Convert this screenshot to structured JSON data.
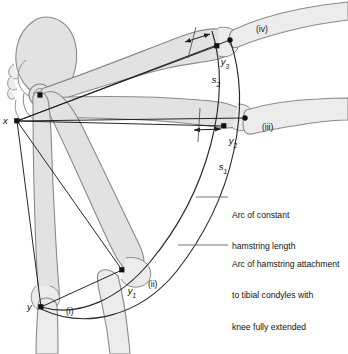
{
  "figure": {
    "type": "anatomical-biomechanics-diagram"
  },
  "points": {
    "x": {
      "label": "x",
      "desc": "hamstring origin at ischial tuberosity",
      "cx": 17,
      "cy": 121
    },
    "y": {
      "label": "y",
      "sub": "",
      "desc": "hamstring attachment, position (i)",
      "cx": 41,
      "cy": 307
    },
    "y1": {
      "label": "y",
      "sub": "1",
      "desc": "hamstring attachment, position (ii)",
      "cx": 122,
      "cy": 270
    },
    "y2": {
      "label": "y",
      "sub": "2",
      "desc": "hamstring attachment, position (iii)",
      "cx": 224,
      "cy": 126
    },
    "y3": {
      "label": "y",
      "sub": "3",
      "desc": "hamstring attachment, position (iv)",
      "cx": 217,
      "cy": 46
    },
    "c3": {
      "desc": "tibial condyle point position (iii)",
      "cx": 245,
      "cy": 118
    },
    "c4": {
      "desc": "tibial condyle point position (iv)",
      "cx": 230,
      "cy": 40
    },
    "hip": {
      "desc": "hip joint centre / femoral head",
      "cx": 40,
      "cy": 95
    }
  },
  "measures": {
    "s1": {
      "label": "s",
      "sub": "1",
      "desc": "shortfall of hamstring length, position (iii)"
    },
    "s2": {
      "label": "s",
      "sub": "2",
      "desc": "shortfall of hamstring length, position (iv)"
    }
  },
  "position_labels": [
    {
      "id": "i",
      "text": "(i)",
      "x": 66,
      "y": 311
    },
    {
      "id": "ii",
      "text": "(ii)",
      "x": 148,
      "y": 284
    },
    {
      "id": "iii",
      "text": "(iii)",
      "x": 262,
      "y": 127
    },
    {
      "id": "iv",
      "text": "(iv)",
      "x": 256,
      "y": 29
    }
  ],
  "annotations": [
    {
      "id": "arc-constant-hamstring-length",
      "lines": [
        "Arc of constant",
        "hamstring length"
      ],
      "text_x": 232,
      "text_y": 192,
      "leader": {
        "x1": 196,
        "y1": 197,
        "x2": 228,
        "y2": 197
      }
    },
    {
      "id": "arc-hamstring-attachment",
      "lines": [
        "Arc of hamstring attachment",
        "to tibial condyles with",
        "knee fully extended"
      ],
      "text_x": 232,
      "text_y": 240,
      "leader": {
        "x1": 178,
        "y1": 245,
        "x2": 228,
        "y2": 245
      }
    }
  ],
  "colors": {
    "bone_fill": "#e2e2e2",
    "bone_fill_light": "#ececec",
    "bone_stroke": "#8a8a8a",
    "line": "#1b1b1b",
    "arc": "#2a2a2a",
    "text": "#111111",
    "background": "#ffffff"
  }
}
